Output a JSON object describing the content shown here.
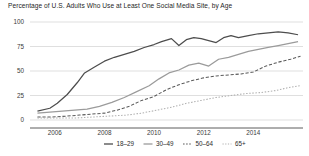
{
  "chart_data": {
    "type": "line",
    "title": "Percentage of U.S. Adults Who Use at Least One Social Media Site, by Age",
    "xlabel": "",
    "ylabel": "",
    "xlim": [
      2005.0,
      2016.0
    ],
    "ylim": [
      0,
      100
    ],
    "grid": true,
    "legend_position": "bottom",
    "xticks": [
      2006,
      2008,
      2010,
      2012,
      2014
    ],
    "xtick_labels": [
      "2006",
      "2008",
      "2010",
      "2012",
      "2014"
    ],
    "yticks": [
      0,
      25,
      50,
      75,
      100
    ],
    "ytick_labels": [
      "0",
      "25",
      "50",
      "75",
      "100"
    ],
    "series": [
      {
        "name": "18-29",
        "label": "18–29",
        "color": "#4d4d4d",
        "style": "solid",
        "x": [
          2005.3,
          2005.8,
          2006.1,
          2006.5,
          2006.9,
          2007.2,
          2007.6,
          2008.0,
          2008.4,
          2008.8,
          2009.2,
          2009.6,
          2010.0,
          2010.3,
          2010.7,
          2011.0,
          2011.3,
          2011.6,
          2011.9,
          2012.2,
          2012.5,
          2012.8,
          2013.1,
          2013.4,
          2013.8,
          2014.2,
          2014.6,
          2015.0,
          2015.4,
          2015.8
        ],
        "y": [
          9,
          12,
          17,
          26,
          38,
          48,
          54,
          60,
          64,
          67,
          70,
          74,
          77,
          80,
          83,
          76,
          82,
          84,
          83,
          81,
          79,
          84,
          86,
          84,
          86,
          88,
          89,
          90,
          89,
          87
        ]
      },
      {
        "name": "30-49",
        "label": "30–49",
        "color": "#9b9b9b",
        "style": "solid",
        "x": [
          2005.3,
          2005.8,
          2006.3,
          2006.8,
          2007.3,
          2007.8,
          2008.3,
          2008.8,
          2009.3,
          2009.8,
          2010.2,
          2010.6,
          2011.0,
          2011.4,
          2011.8,
          2012.2,
          2012.6,
          2013.0,
          2013.4,
          2013.8,
          2014.2,
          2014.6,
          2015.0,
          2015.4,
          2015.8
        ],
        "y": [
          7,
          8,
          9,
          10,
          11,
          14,
          18,
          23,
          29,
          35,
          42,
          48,
          51,
          56,
          58,
          55,
          62,
          64,
          67,
          70,
          72,
          74,
          76,
          78,
          80
        ]
      },
      {
        "name": "50-64",
        "label": "50–64",
        "color": "#5a5a5a",
        "style": "dashed",
        "x": [
          2005.3,
          2005.9,
          2006.5,
          2007.0,
          2007.5,
          2008.0,
          2008.5,
          2009.0,
          2009.5,
          2010.0,
          2010.5,
          2011.0,
          2011.5,
          2012.0,
          2012.5,
          2013.0,
          2013.5,
          2014.0,
          2014.5,
          2015.0,
          2015.5,
          2015.9
        ],
        "y": [
          3,
          3,
          4,
          5,
          6,
          7,
          10,
          14,
          20,
          24,
          31,
          36,
          40,
          43,
          45,
          46,
          47,
          49,
          55,
          59,
          62,
          65
        ]
      },
      {
        "name": "65+",
        "label": "65+",
        "color": "#b0b0b0",
        "style": "dotted",
        "x": [
          2005.3,
          2006.0,
          2006.8,
          2007.5,
          2008.2,
          2008.9,
          2009.5,
          2010.1,
          2010.7,
          2011.3,
          2011.9,
          2012.5,
          2013.1,
          2013.7,
          2014.3,
          2014.9,
          2015.4,
          2015.9
        ],
        "y": [
          2,
          2,
          2,
          3,
          4,
          5,
          7,
          10,
          13,
          17,
          20,
          23,
          25,
          27,
          28,
          30,
          33,
          35
        ]
      }
    ]
  },
  "legend": {
    "items": [
      {
        "label": "18–29",
        "marker": "solid-dark"
      },
      {
        "label": "30–49",
        "marker": "solid-gray"
      },
      {
        "label": "50–64",
        "marker": "dashed-dark"
      },
      {
        "label": "65+",
        "marker": "dotted-gray"
      }
    ]
  }
}
